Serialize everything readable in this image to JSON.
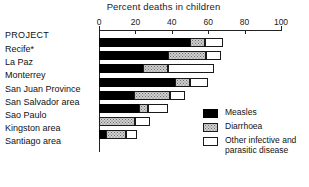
{
  "chart_data": {
    "type": "bar",
    "orientation": "horizontal",
    "stacked": true,
    "title": "Percent deaths in children",
    "xlabel": "",
    "ylabel": "PROJECT",
    "xlim": [
      0,
      100
    ],
    "xticks": [
      0,
      20,
      40,
      60,
      80,
      100
    ],
    "grid": false,
    "legend_position": "right",
    "categories": [
      "Recife*",
      "La Paz",
      "Monterrey",
      "San Juan Province",
      "San Salvador area",
      "Sao Paulo",
      "Kingston area",
      "Santiago area"
    ],
    "series": [
      {
        "name": "Measles",
        "color": "#000000",
        "values": [
          50,
          38,
          24,
          42,
          19,
          22,
          0,
          4
        ]
      },
      {
        "name": "Diarrhoea",
        "color": "#cfcfcf",
        "values": [
          8,
          21,
          14,
          8,
          20,
          5,
          20,
          11
        ]
      },
      {
        "name": "Other infective and parasitic disease",
        "color": "#ffffff",
        "values": [
          10,
          8,
          25,
          10,
          8,
          11,
          8,
          6
        ]
      }
    ],
    "totals": [
      68,
      67,
      63,
      60,
      47,
      38,
      28,
      21
    ]
  },
  "axis": {
    "header": "PROJECT",
    "tick_labels": [
      "0",
      "20",
      "40",
      "60",
      "80",
      "100"
    ]
  },
  "legend": {
    "items": [
      {
        "label": "Measles",
        "swatch": "measles"
      },
      {
        "label": "Diarrhoea",
        "swatch": "diarrhoea"
      },
      {
        "label": "Other infective and\nparasitic disease",
        "swatch": "other"
      }
    ]
  }
}
